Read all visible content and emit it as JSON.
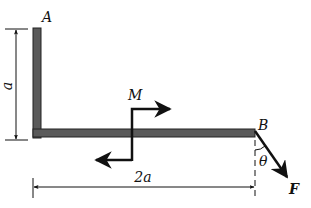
{
  "diagram": {
    "type": "L-shaped bar statics diagram",
    "points": {
      "A": "A",
      "B": "B"
    },
    "moment_label": "M",
    "force_label": "F",
    "angle_label": "θ",
    "dim_vertical": "a",
    "dim_horizontal": "2a",
    "colors": {
      "bar": "#555555",
      "line": "#111111",
      "background": "#ffffff"
    }
  }
}
